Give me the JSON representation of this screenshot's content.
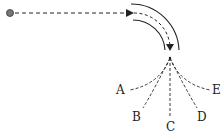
{
  "diagram": {
    "type": "curved-tube-trajectory",
    "colors": {
      "line": "#222222",
      "ball": "#777777"
    },
    "ball": {
      "x": 10,
      "y": 13
    },
    "paths": [
      {
        "id": "A",
        "label": "A",
        "label_x": 116,
        "label_y": 84
      },
      {
        "id": "B",
        "label": "B",
        "label_x": 132,
        "label_y": 111
      },
      {
        "id": "C",
        "label": "C",
        "label_x": 166,
        "label_y": 121
      },
      {
        "id": "D",
        "label": "D",
        "label_x": 197,
        "label_y": 111
      },
      {
        "id": "E",
        "label": "E",
        "label_x": 212,
        "label_y": 84
      }
    ]
  }
}
